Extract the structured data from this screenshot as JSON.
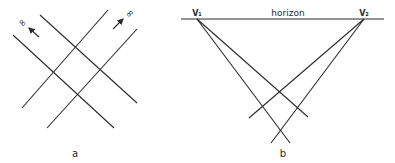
{
  "panel_a": {
    "label": "a",
    "infinity_left": "∞",
    "infinity_right": "∞",
    "lines": [
      {
        "x1": 13,
        "y1": 35,
        "x2": 114,
        "y2": 128
      },
      {
        "x1": 40,
        "y1": 15,
        "x2": 137,
        "y2": 103
      },
      {
        "x1": 22,
        "y1": 108,
        "x2": 108,
        "y2": 10
      },
      {
        "x1": 47,
        "y1": 128,
        "x2": 137,
        "y2": 29
      }
    ]
  },
  "panel_b": {
    "label": "b",
    "horizon_label": "horizon",
    "vanishing_point_1": "V₁",
    "vanishing_point_2": "V₂",
    "lines": [
      {
        "x1": 197,
        "y1": 19,
        "x2": 290,
        "y2": 143
      },
      {
        "x1": 197,
        "y1": 19,
        "x2": 308,
        "y2": 117
      },
      {
        "x1": 364,
        "y1": 19,
        "x2": 249,
        "y2": 118
      },
      {
        "x1": 364,
        "y1": 19,
        "x2": 271,
        "y2": 143
      }
    ]
  }
}
